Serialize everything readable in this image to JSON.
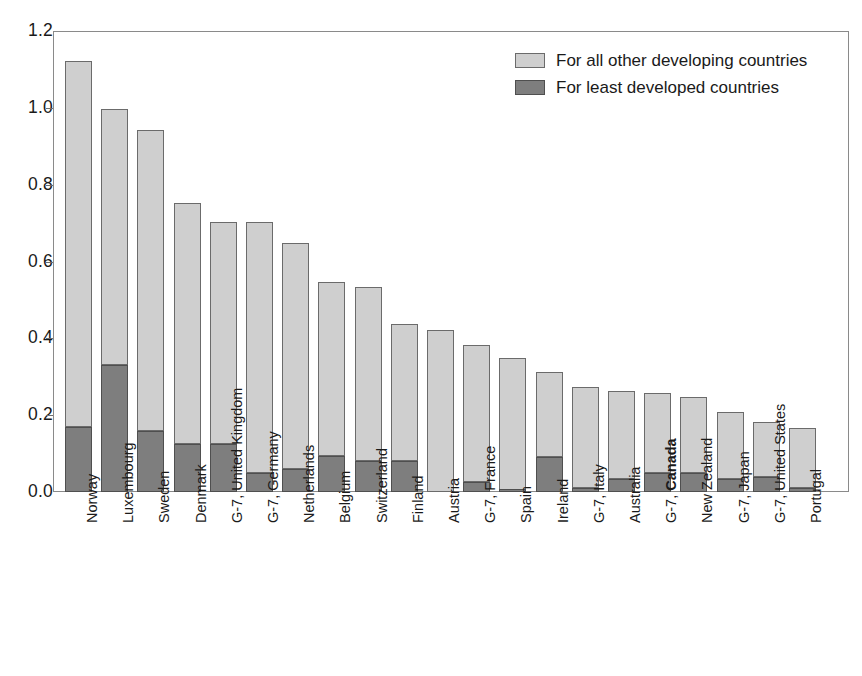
{
  "chart_data": {
    "type": "bar",
    "subtype": "stacked-vertical",
    "title": "",
    "xlabel": "",
    "ylabel": "",
    "ylim": [
      0.0,
      1.2
    ],
    "ytick_labels": [
      "0.0",
      "0.2",
      "0.4",
      "0.6",
      "0.8",
      "1.0",
      "1.2"
    ],
    "ytick_values": [
      0.0,
      0.2,
      0.4,
      0.6,
      0.8,
      1.0,
      1.2
    ],
    "grid": false,
    "legend_position": "top-right",
    "highlight_category": "G-7, Canada",
    "categories": [
      "Norway",
      "Luxembourg",
      "Sweden",
      "Denmark",
      "G-7, United Kingdom",
      "G-7, Germany",
      "Netherlands",
      "Belgium",
      "Switzerland",
      "Finland",
      "Austria",
      "G-7, France",
      "Spain",
      "Ireland",
      "G-7, Italy",
      "Australia",
      "G-7, Canada",
      "New Zealand",
      "G-7, Japan",
      "G-7, United States",
      "Portugal"
    ],
    "series": [
      {
        "name": "For least developed countries",
        "color": "#7e7e7e",
        "values": [
          0.17,
          0.33,
          0.16,
          0.125,
          0.125,
          0.05,
          0.06,
          0.095,
          0.08,
          0.08,
          0.0,
          0.025,
          0.005,
          0.09,
          0.01,
          0.035,
          0.05,
          0.05,
          0.035,
          0.04,
          0.01
        ]
      },
      {
        "name": "For all other developing countries",
        "color": "#cfcfcf",
        "values": [
          0.95,
          0.665,
          0.78,
          0.625,
          0.575,
          0.65,
          0.585,
          0.45,
          0.45,
          0.355,
          0.42,
          0.355,
          0.34,
          0.22,
          0.26,
          0.225,
          0.205,
          0.195,
          0.17,
          0.14,
          0.155
        ]
      }
    ],
    "totals": [
      1.12,
      0.995,
      0.94,
      0.75,
      0.7,
      0.7,
      0.645,
      0.545,
      0.53,
      0.435,
      0.42,
      0.38,
      0.345,
      0.31,
      0.27,
      0.26,
      0.255,
      0.245,
      0.205,
      0.18,
      0.165
    ]
  },
  "legend": {
    "entries": [
      {
        "label": "For all other developing countries",
        "swatch": "other"
      },
      {
        "label": "For least developed countries",
        "swatch": "least"
      }
    ]
  },
  "colors": {
    "other_developing": "#cfcfcf",
    "least_developed": "#7e7e7e",
    "frame": "#8a8a8a",
    "text": "#1a1a1a",
    "background": "#ffffff"
  }
}
